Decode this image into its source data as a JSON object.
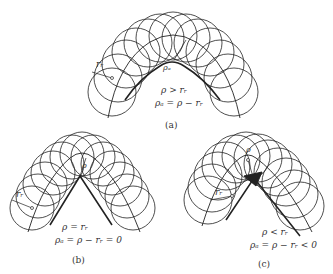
{
  "figure": {
    "panels": [
      {
        "id": "a",
        "caption": "(a)",
        "condition": "ρ > rᵣ",
        "equation": "ρₐ = ρ − rᵣ",
        "rho_label": "ρₐ",
        "rho_top_label": "ρ",
        "roller_label": "rᵣ",
        "case": "pitch curve radius greater than roller radius"
      },
      {
        "id": "b",
        "caption": "(b)",
        "condition": "ρ = rᵣ",
        "equation": "ρₐ = ρ − rᵣ = 0",
        "rho_top_label": "ρ",
        "roller_label": "rᵣ",
        "case": "pitch curve radius equal to roller radius (pointed profile)"
      },
      {
        "id": "c",
        "caption": "(c)",
        "condition": "ρ < rᵣ",
        "equation": "ρₐ = ρ − rᵣ < 0",
        "rho_top_label": "ρ",
        "roller_label": "rᵣ",
        "case": "pitch curve radius less than roller radius (undercut / looped profile)"
      }
    ],
    "colors": {
      "line": "#222222",
      "background": "#ffffff"
    }
  }
}
